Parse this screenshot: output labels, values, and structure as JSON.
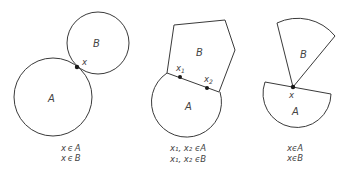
{
  "figure": {
    "panels": [
      {
        "id": "tangent-circles",
        "region_A_label": "A",
        "region_B_label": "B",
        "points": [
          "x"
        ],
        "captions": [
          "x ϵ A",
          "x ϵ B"
        ]
      },
      {
        "id": "shared-boundary",
        "region_A_label": "A",
        "region_B_label": "B",
        "points": [
          "x",
          "x"
        ],
        "point_subscripts": [
          "1",
          "2"
        ],
        "captions": [
          "x₁, x₂ ϵA",
          "x₁, x₂ ϵB"
        ]
      },
      {
        "id": "single-point-contact",
        "region_A_label": "A",
        "region_B_label": "B",
        "points": [
          "x"
        ],
        "captions": [
          "xϵA",
          "xϵB"
        ]
      }
    ],
    "colors": {
      "stroke": "#3a3a3a",
      "point": "#1a1a1a",
      "text": "#444444"
    }
  }
}
